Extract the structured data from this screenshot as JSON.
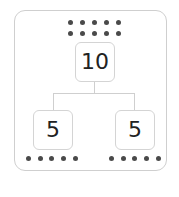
{
  "diagram": {
    "type": "number-bond",
    "whole": {
      "value": "10",
      "dots": 10
    },
    "parts": [
      {
        "value": "5",
        "dots": 5
      },
      {
        "value": "5",
        "dots": 5
      }
    ],
    "colors": {
      "dot": "#4a4a4a",
      "border": "#cfcfcf",
      "text": "#222222"
    }
  }
}
